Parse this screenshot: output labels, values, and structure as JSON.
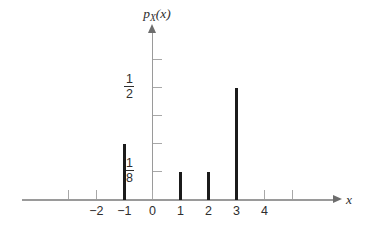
{
  "chart_data": {
    "type": "bar",
    "title": "",
    "subtitle": "",
    "xlabel": "x",
    "ylabel": "p_X(x)",
    "ylabel_base": "p",
    "ylabel_sub": "X",
    "ylabel_arg": "(x)",
    "x": [
      -1,
      1,
      2,
      3
    ],
    "values": [
      0.25,
      0.125,
      0.125,
      0.5
    ],
    "value_labels": [
      "1/4",
      "1/8",
      "1/8",
      "1/2"
    ],
    "xlim": [
      -3.6,
      5.9
    ],
    "ylim": [
      0,
      0.625
    ],
    "grid": false,
    "legend": null,
    "x_ticks": [
      {
        "value": -3,
        "label": ""
      },
      {
        "value": -2,
        "label": "−2"
      },
      {
        "value": -1,
        "label": "−1"
      },
      {
        "value": 0,
        "label": "0"
      },
      {
        "value": 1,
        "label": "1"
      },
      {
        "value": 2,
        "label": "2"
      },
      {
        "value": 3,
        "label": "3"
      },
      {
        "value": 4,
        "label": "4"
      },
      {
        "value": 5,
        "label": ""
      }
    ],
    "y_ticks": [
      {
        "value": 0.125,
        "label_num": "1",
        "label_den": "8"
      },
      {
        "value": 0.25,
        "label_num": "",
        "label_den": ""
      },
      {
        "value": 0.375,
        "label_num": "",
        "label_den": ""
      },
      {
        "value": 0.5,
        "label_num": "1",
        "label_den": "2"
      },
      {
        "value": 0.625,
        "label_num": "",
        "label_den": ""
      }
    ],
    "colors": {
      "stem": "#1b1b1b",
      "axis": "#9a9a9a",
      "tick": "#a8a8a8",
      "text": "#2e2e2e",
      "background": "#ffffff"
    }
  }
}
